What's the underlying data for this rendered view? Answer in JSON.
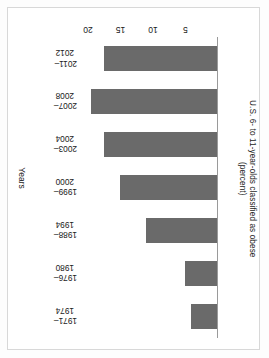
{
  "chart_data": {
    "type": "bar",
    "orientation": "horizontal-rotated-180",
    "title": "",
    "xlabel": "Years",
    "ylabel": "U.S. 6- to 11-year-olds classified as obese (percent)",
    "ylabel_line1": "U.S. 6- to 11-year-olds classified as obese",
    "ylabel_line2": "(percent)",
    "categories": [
      "1971–1974",
      "1976–1980",
      "1988–1994",
      "1999–2000",
      "2003–2004",
      "2007–2008",
      "2011–2012"
    ],
    "category_lines": [
      {
        "line1": "1971–",
        "line2": "1974"
      },
      {
        "line1": "1976–",
        "line2": "1980"
      },
      {
        "line1": "1988–",
        "line2": "1994"
      },
      {
        "line1": "1999–",
        "line2": "2000"
      },
      {
        "line1": "2003–",
        "line2": "2004"
      },
      {
        "line1": "2007–",
        "line2": "2008"
      },
      {
        "line1": "2011–",
        "line2": "2012"
      }
    ],
    "values": [
      4,
      5,
      11,
      15,
      17.5,
      19.5,
      17.5
    ],
    "tick_labels": [
      "5",
      "10",
      "15",
      "20"
    ],
    "tick_values": [
      5,
      10,
      15,
      20
    ],
    "ylim": [
      0,
      22
    ],
    "grid": false,
    "legend": false,
    "bar_color": "#6a6a6a",
    "axis_color": "#9a9a9a",
    "text_color": "#1a1a1a",
    "background": "#ffffff"
  }
}
